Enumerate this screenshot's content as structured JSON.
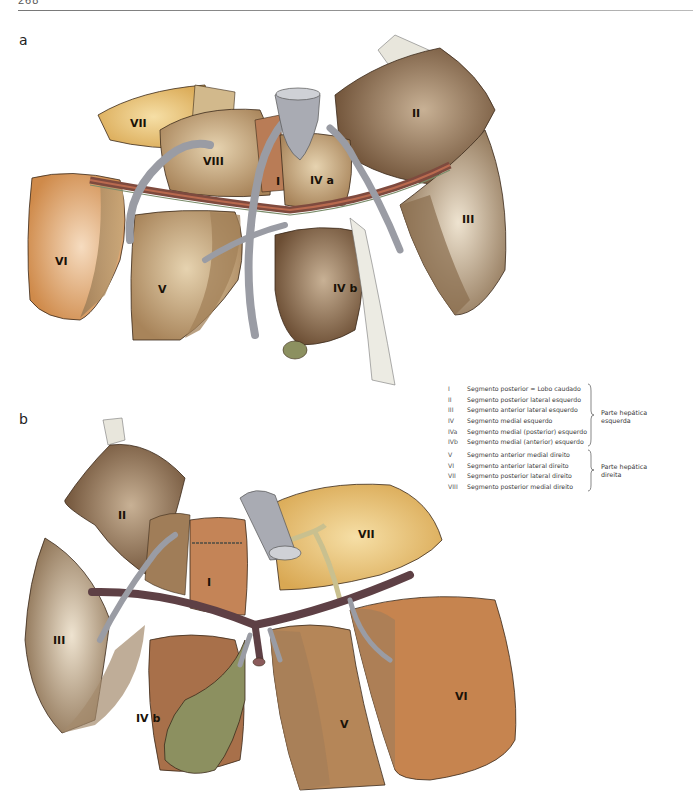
{
  "header": {
    "page_number": "268"
  },
  "figure_a": {
    "label": "a",
    "segments": [
      {
        "id": "VII",
        "label": "VII"
      },
      {
        "id": "VIII",
        "label": "VIII"
      },
      {
        "id": "I",
        "label": "I"
      },
      {
        "id": "IVa",
        "label": "IV a"
      },
      {
        "id": "II",
        "label": "II"
      },
      {
        "id": "III",
        "label": "III"
      },
      {
        "id": "VI",
        "label": "VI"
      },
      {
        "id": "V",
        "label": "V"
      },
      {
        "id": "IVb",
        "label": "IV b"
      }
    ]
  },
  "figure_b": {
    "label": "b",
    "segments": [
      {
        "id": "II",
        "label": "II"
      },
      {
        "id": "III",
        "label": "III"
      },
      {
        "id": "I",
        "label": "I"
      },
      {
        "id": "VII",
        "label": "VII"
      },
      {
        "id": "IVb",
        "label": "IV b"
      },
      {
        "id": "V",
        "label": "V"
      },
      {
        "id": "VI",
        "label": "VI"
      }
    ]
  },
  "legend": {
    "left_group": {
      "items": [
        {
          "num": "I",
          "text": "Segmento posterior = Lobo caudado"
        },
        {
          "num": "II",
          "text": "Segmento posterior lateral esquerdo"
        },
        {
          "num": "III",
          "text": "Segmento anterior lateral esquerdo"
        },
        {
          "num": "IV",
          "text": "Segmento medial esquerdo"
        },
        {
          "num": "IVa",
          "text": "Segmento medial (posterior) esquerdo"
        },
        {
          "num": "IVb",
          "text": "Segmento medial (anterior) esquerdo"
        }
      ],
      "part_line1": "Parte hepática",
      "part_line2": "esquerda"
    },
    "right_group": {
      "items": [
        {
          "num": "V",
          "text": "Segmento anterior medial direito"
        },
        {
          "num": "VI",
          "text": "Segmento anterior lateral direito"
        },
        {
          "num": "VII",
          "text": "Segmento posterior lateral direito"
        },
        {
          "num": "VIII",
          "text": "Segmento posterior medial direito"
        }
      ],
      "part_line1": "Parte hepática",
      "part_line2": "direita"
    }
  },
  "colors": {
    "segment_light": "#e8c07a",
    "segment_tan": "#b8976a",
    "segment_brown": "#6e5138",
    "segment_orange": "#c98a55",
    "vessel_gray": "#9a9ca4",
    "portal_vein": "#6b4a4e",
    "gallbladder": "#8c9060"
  }
}
